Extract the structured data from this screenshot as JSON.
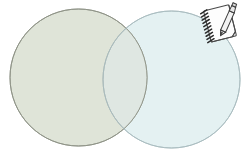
{
  "figure": {
    "type": "venn-diagram",
    "title": "",
    "background_color": "#ffffff",
    "width": 249,
    "height": 155
  },
  "chart_data": {
    "type": "venn",
    "title": "",
    "subtitle": "",
    "xlabel": "",
    "ylabel": "",
    "grid": false,
    "legend_position": "none",
    "sets": [
      {
        "name": "set-a",
        "label": "",
        "fill_color": "#dfe4d8",
        "stroke_color": "#8d9286",
        "center_x": 78.5,
        "center_y": 77.5,
        "radius": 68.5,
        "opacity": 1.0
      },
      {
        "name": "set-b",
        "label": "",
        "fill_color": "#e4f1f2",
        "stroke_color": "#a9bcc0",
        "center_x": 171.5,
        "center_y": 79.5,
        "radius": 68.5,
        "opacity": 1.0
      }
    ],
    "intersection": {
      "name": "set-a-intersect-set-b",
      "label": "",
      "fill_color": "#dfe7e2"
    }
  },
  "annotations": {
    "notepad": {
      "icon_name": "notepad-pencil-icon",
      "label": "",
      "paper_color": "#fdfdfd",
      "line_color": "#4a4a4a",
      "spiral_color": "#2b2b2b",
      "pencil_body_color": "#f2f2f2",
      "pencil_outline_color": "#3d3d3d",
      "x": 200,
      "y": 0,
      "width": 49,
      "height": 50
    }
  }
}
